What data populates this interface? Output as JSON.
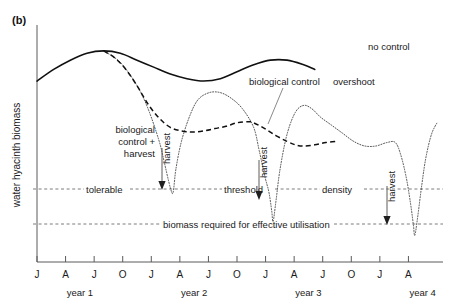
{
  "figure": {
    "panel_label": "(b)",
    "y_axis_title": "water hyacinth biomass"
  },
  "chart_data": {
    "type": "line",
    "title": "",
    "xlabel": "",
    "ylabel": "water hyacinth biomass",
    "grid": false,
    "legend": "inline-annotations",
    "x_ticks": [
      "J",
      "A",
      "J",
      "O",
      "J",
      "A",
      "J",
      "O",
      "J",
      "A",
      "J",
      "O",
      "J",
      "A"
    ],
    "x_tick_months": [
      "Jan",
      "Apr",
      "Jul",
      "Oct",
      "Jan",
      "Apr",
      "Jul",
      "Oct",
      "Jan",
      "Apr",
      "Jul",
      "Oct",
      "Jan",
      "Apr"
    ],
    "x_groups": [
      "year 1",
      "year 2",
      "year 3",
      "year 4"
    ],
    "y_axis_units": "relative (unlabelled)",
    "ylim": [
      0,
      1
    ],
    "reference_lines": [
      {
        "name": "tolerable-threshold-density",
        "label_parts": [
          "tolerable",
          "threshold",
          "density"
        ],
        "full_label": "tolerable threshold density",
        "y_value": 0.3
      },
      {
        "name": "biomass-required-for-effective-utilisation",
        "label_parts": [
          "biomass required for effective utilisation"
        ],
        "full_label": "biomass required for effective utilisation",
        "y_value": 0.14
      }
    ],
    "series": [
      {
        "name": "no control",
        "style": "solid",
        "label": "no control",
        "points": [
          [
            0.0,
            0.78
          ],
          [
            0.06,
            0.83
          ],
          [
            0.12,
            0.87
          ],
          [
            0.18,
            0.9
          ],
          [
            0.24,
            0.91
          ],
          [
            0.3,
            0.9
          ],
          [
            0.36,
            0.87
          ],
          [
            0.42,
            0.84
          ],
          [
            0.48,
            0.81
          ],
          [
            0.54,
            0.79
          ],
          [
            0.6,
            0.78
          ],
          [
            0.66,
            0.79
          ],
          [
            0.72,
            0.82
          ],
          [
            0.78,
            0.85
          ],
          [
            0.84,
            0.87
          ],
          [
            0.9,
            0.87
          ],
          [
            0.96,
            0.85
          ],
          [
            1.0,
            0.83
          ]
        ]
      },
      {
        "name": "biological control",
        "style": "dashed",
        "label": "biological control",
        "points": [
          [
            0.24,
            0.91
          ],
          [
            0.28,
            0.88
          ],
          [
            0.32,
            0.83
          ],
          [
            0.36,
            0.76
          ],
          [
            0.4,
            0.68
          ],
          [
            0.44,
            0.62
          ],
          [
            0.48,
            0.58
          ],
          [
            0.52,
            0.565
          ],
          [
            0.56,
            0.56
          ],
          [
            0.6,
            0.565
          ],
          [
            0.64,
            0.575
          ],
          [
            0.68,
            0.585
          ],
          [
            0.72,
            0.6
          ],
          [
            0.76,
            0.605
          ],
          [
            0.78,
            0.6
          ],
          [
            0.82,
            0.575
          ],
          [
            0.86,
            0.545
          ],
          [
            0.9,
            0.52
          ],
          [
            0.93,
            0.505
          ],
          [
            0.96,
            0.5
          ],
          [
            1.0,
            0.505
          ],
          [
            1.04,
            0.515
          ],
          [
            1.08,
            0.52
          ]
        ]
      },
      {
        "name": "biological control + harvest",
        "style": "dotted",
        "label": "biological control + harvest",
        "points": [
          [
            0.24,
            0.91
          ],
          [
            0.3,
            0.86
          ],
          [
            0.36,
            0.76
          ],
          [
            0.4,
            0.66
          ],
          [
            0.44,
            0.52
          ],
          [
            0.46,
            0.42
          ],
          [
            0.48,
            0.32
          ],
          [
            0.49,
            0.3
          ],
          [
            0.5,
            0.4
          ],
          [
            0.52,
            0.52
          ],
          [
            0.55,
            0.63
          ],
          [
            0.58,
            0.7
          ],
          [
            0.62,
            0.73
          ],
          [
            0.66,
            0.73
          ],
          [
            0.7,
            0.705
          ],
          [
            0.74,
            0.66
          ],
          [
            0.78,
            0.58
          ],
          [
            0.8,
            0.48
          ],
          [
            0.82,
            0.37
          ],
          [
            0.835,
            0.3
          ],
          [
            0.845,
            0.22
          ],
          [
            0.85,
            0.175
          ],
          [
            0.86,
            0.26
          ],
          [
            0.875,
            0.4
          ],
          [
            0.9,
            0.55
          ],
          [
            0.93,
            0.645
          ],
          [
            0.96,
            0.675
          ],
          [
            0.99,
            0.66
          ],
          [
            1.02,
            0.625
          ],
          [
            1.06,
            0.59
          ],
          [
            1.1,
            0.555
          ],
          [
            1.14,
            0.52
          ],
          [
            1.18,
            0.5
          ],
          [
            1.22,
            0.5
          ],
          [
            1.26,
            0.515
          ],
          [
            1.29,
            0.515
          ],
          [
            1.31,
            0.46
          ],
          [
            1.33,
            0.36
          ],
          [
            1.345,
            0.25
          ],
          [
            1.355,
            0.16
          ],
          [
            1.36,
            0.115
          ],
          [
            1.37,
            0.19
          ],
          [
            1.385,
            0.33
          ],
          [
            1.4,
            0.45
          ],
          [
            1.42,
            0.55
          ],
          [
            1.44,
            0.6
          ]
        ]
      }
    ],
    "annotations": [
      {
        "name": "no-control-label",
        "text": "no control",
        "x_px": 368,
        "y_px": 50
      },
      {
        "name": "biological-control-label",
        "text": "biological control",
        "x_px": 249,
        "y_px": 82
      },
      {
        "name": "overshoot-label",
        "text": "overshoot",
        "x_px": 333,
        "y_px": 84
      },
      {
        "name": "biological-control-harvest-label",
        "text": "biological control + harvest",
        "x_px": 153,
        "y_px": 130
      },
      {
        "name": "harvest-label-1",
        "text": "harvest",
        "x_px": 165,
        "y_px": 158
      },
      {
        "name": "harvest-label-2",
        "text": "harvest",
        "x_px": 262,
        "y_px": 170
      },
      {
        "name": "harvest-label-3",
        "text": "harvest",
        "x_px": 390,
        "y_px": 190
      }
    ],
    "harvest_events": [
      {
        "name": "harvest-1",
        "label": "harvest",
        "to_y": 0.3,
        "note": "down to tolerable threshold density"
      },
      {
        "name": "harvest-2",
        "label": "harvest",
        "to_y": 0.22,
        "note": "below tolerable threshold density"
      },
      {
        "name": "harvest-3",
        "label": "harvest",
        "to_y": 0.14,
        "note": "down to biomass required for effective utilisation"
      }
    ]
  },
  "annotation_text": {
    "bio_control_harvest_line1": "biological",
    "bio_control_harvest_line2": "control +",
    "bio_control_harvest_line3": "harvest",
    "harvest": "harvest",
    "no_control": "no control",
    "biological_control": "biological control",
    "overshoot": "overshoot",
    "tolerable": "tolerable",
    "threshold": "threshold",
    "density": "density",
    "biomass_required": "biomass required for effective utilisation"
  },
  "colors": {
    "ink": "#111111",
    "axis": "#5a5a5a",
    "reference": "#6e6e6e",
    "background": "#ffffff"
  }
}
